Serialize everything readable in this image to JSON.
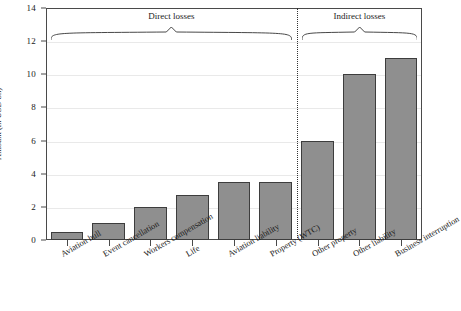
{
  "chart_data": {
    "type": "bar",
    "title": "",
    "xlabel": "",
    "ylabel": "Amount (in USD bn)",
    "ylim": [
      0,
      14
    ],
    "ytick_labels": [
      "0",
      "2",
      "4",
      "6",
      "8",
      "10",
      "12",
      "14"
    ],
    "yticks": [
      0,
      2,
      4,
      6,
      8,
      10,
      12,
      14
    ],
    "grid": true,
    "legend": "none",
    "categories": [
      "Aviation hull",
      "Event cancellation",
      "Workers compensation",
      "Life",
      "Aviation liability",
      "Property (WTC)",
      "Other property",
      "Other liability",
      "Business interruption"
    ],
    "values": [
      0.5,
      1.0,
      2.0,
      2.7,
      3.5,
      3.5,
      6.0,
      10.0,
      11.0
    ],
    "annotations": [
      {
        "label": "Direct losses",
        "covers": [
          0,
          5
        ]
      },
      {
        "label": "Indirect losses",
        "covers": [
          6,
          8
        ]
      }
    ],
    "divider": {
      "after_category_index": 5,
      "style": "dotted"
    },
    "bar_color": "#8f8f8f",
    "bar_edge_color": "#3d3d3d",
    "axis_color": "#4a4a4a"
  }
}
